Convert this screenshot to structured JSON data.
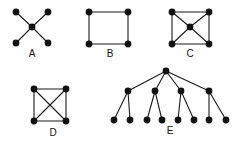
{
  "figure": {
    "background_color": "#ffffff",
    "node_color": "#111111",
    "edge_color": "#1a1a1a",
    "label_color": "#111111",
    "node_radius": 3.4,
    "edge_width": 1.1,
    "width": 243,
    "height": 146
  },
  "graphs": [
    {
      "id": "A",
      "label": "A",
      "description": "Star graph with a central vertex joined to four outer vertices forming an X",
      "vertex_count": 5,
      "edge_count": 4,
      "label_position": {
        "x": 32,
        "y": 54
      },
      "nodes": [
        {
          "name": "a-center",
          "x": 32,
          "y": 27
        },
        {
          "name": "a-top-left",
          "x": 16,
          "y": 12
        },
        {
          "name": "a-top-right",
          "x": 48,
          "y": 12
        },
        {
          "name": "a-bottom-left",
          "x": 16,
          "y": 43
        },
        {
          "name": "a-bottom-right",
          "x": 48,
          "y": 43
        }
      ],
      "edges": [
        {
          "from": "a-center",
          "to": "a-top-left"
        },
        {
          "from": "a-center",
          "to": "a-top-right"
        },
        {
          "from": "a-center",
          "to": "a-bottom-left"
        },
        {
          "from": "a-center",
          "to": "a-bottom-right"
        }
      ]
    },
    {
      "id": "B",
      "label": "B",
      "description": "Four cycle drawn as a square",
      "vertex_count": 4,
      "edge_count": 4,
      "label_position": {
        "x": 110,
        "y": 54
      },
      "nodes": [
        {
          "name": "b-top-left",
          "x": 89,
          "y": 12
        },
        {
          "name": "b-top-right",
          "x": 128,
          "y": 12
        },
        {
          "name": "b-bottom-left",
          "x": 89,
          "y": 44
        },
        {
          "name": "b-bottom-right",
          "x": 128,
          "y": 44
        }
      ],
      "edges": [
        {
          "from": "b-top-left",
          "to": "b-top-right"
        },
        {
          "from": "b-top-right",
          "to": "b-bottom-right"
        },
        {
          "from": "b-bottom-right",
          "to": "b-bottom-left"
        },
        {
          "from": "b-bottom-left",
          "to": "b-top-left"
        }
      ]
    },
    {
      "id": "C",
      "label": "C",
      "description": "Wheel graph: square with a central vertex joined to all four corners",
      "vertex_count": 5,
      "edge_count": 8,
      "label_position": {
        "x": 190,
        "y": 54
      },
      "nodes": [
        {
          "name": "c-center",
          "x": 190,
          "y": 27
        },
        {
          "name": "c-top-left",
          "x": 172,
          "y": 12
        },
        {
          "name": "c-top-right",
          "x": 209,
          "y": 12
        },
        {
          "name": "c-bottom-left",
          "x": 172,
          "y": 44
        },
        {
          "name": "c-bottom-right",
          "x": 209,
          "y": 44
        }
      ],
      "edges": [
        {
          "from": "c-top-left",
          "to": "c-top-right"
        },
        {
          "from": "c-top-right",
          "to": "c-bottom-right"
        },
        {
          "from": "c-bottom-right",
          "to": "c-bottom-left"
        },
        {
          "from": "c-bottom-left",
          "to": "c-top-left"
        },
        {
          "from": "c-center",
          "to": "c-top-left"
        },
        {
          "from": "c-center",
          "to": "c-top-right"
        },
        {
          "from": "c-center",
          "to": "c-bottom-left"
        },
        {
          "from": "c-center",
          "to": "c-bottom-right"
        }
      ]
    },
    {
      "id": "D",
      "label": "D",
      "description": "Complete graph on four vertices: square with both diagonals",
      "vertex_count": 4,
      "edge_count": 6,
      "label_position": {
        "x": 53,
        "y": 133
      },
      "nodes": [
        {
          "name": "d-top-left",
          "x": 34,
          "y": 89
        },
        {
          "name": "d-top-right",
          "x": 66,
          "y": 89
        },
        {
          "name": "d-bottom-left",
          "x": 34,
          "y": 121
        },
        {
          "name": "d-bottom-right",
          "x": 66,
          "y": 121
        }
      ],
      "edges": [
        {
          "from": "d-top-left",
          "to": "d-top-right"
        },
        {
          "from": "d-top-right",
          "to": "d-bottom-right"
        },
        {
          "from": "d-bottom-right",
          "to": "d-bottom-left"
        },
        {
          "from": "d-bottom-left",
          "to": "d-top-left"
        },
        {
          "from": "d-top-left",
          "to": "d-bottom-right"
        },
        {
          "from": "d-top-right",
          "to": "d-bottom-left"
        }
      ]
    },
    {
      "id": "E",
      "label": "E",
      "description": "Rooted tree: root with four children, each child having two leaf children",
      "vertex_count": 13,
      "edge_count": 12,
      "label_position": {
        "x": 170,
        "y": 131
      },
      "nodes": [
        {
          "name": "e-root",
          "x": 166,
          "y": 71
        },
        {
          "name": "e-branch-1",
          "x": 128,
          "y": 91
        },
        {
          "name": "e-branch-2",
          "x": 155,
          "y": 91
        },
        {
          "name": "e-branch-3",
          "x": 181,
          "y": 91
        },
        {
          "name": "e-branch-4",
          "x": 209,
          "y": 91
        },
        {
          "name": "e-leaf-1",
          "x": 114,
          "y": 120
        },
        {
          "name": "e-leaf-2",
          "x": 130,
          "y": 120
        },
        {
          "name": "e-leaf-3",
          "x": 147,
          "y": 120
        },
        {
          "name": "e-leaf-4",
          "x": 162,
          "y": 120
        },
        {
          "name": "e-leaf-5",
          "x": 178,
          "y": 120
        },
        {
          "name": "e-leaf-6",
          "x": 194,
          "y": 120
        },
        {
          "name": "e-leaf-7",
          "x": 209,
          "y": 120
        },
        {
          "name": "e-leaf-8",
          "x": 226,
          "y": 120
        }
      ],
      "edges": [
        {
          "from": "e-root",
          "to": "e-branch-1"
        },
        {
          "from": "e-root",
          "to": "e-branch-2"
        },
        {
          "from": "e-root",
          "to": "e-branch-3"
        },
        {
          "from": "e-root",
          "to": "e-branch-4"
        },
        {
          "from": "e-branch-1",
          "to": "e-leaf-1"
        },
        {
          "from": "e-branch-1",
          "to": "e-leaf-2"
        },
        {
          "from": "e-branch-2",
          "to": "e-leaf-3"
        },
        {
          "from": "e-branch-2",
          "to": "e-leaf-4"
        },
        {
          "from": "e-branch-3",
          "to": "e-leaf-5"
        },
        {
          "from": "e-branch-3",
          "to": "e-leaf-6"
        },
        {
          "from": "e-branch-4",
          "to": "e-leaf-7"
        },
        {
          "from": "e-branch-4",
          "to": "e-leaf-8"
        }
      ]
    }
  ]
}
